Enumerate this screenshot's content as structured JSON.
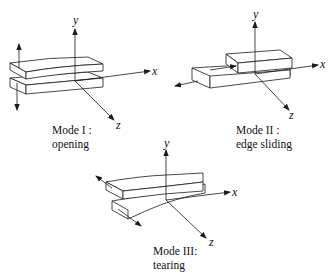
{
  "figure": {
    "modes": [
      {
        "id": "mode-1",
        "title": "Mode I :",
        "subtitle": "opening",
        "axes": {
          "x": "x",
          "y": "y",
          "z": "z"
        }
      },
      {
        "id": "mode-2",
        "title": "Mode II :",
        "subtitle": "edge sliding",
        "axes": {
          "x": "x",
          "y": "y",
          "z": "z"
        }
      },
      {
        "id": "mode-3",
        "title": "Mode III:",
        "subtitle": "tearing",
        "axes": {
          "x": "x",
          "y": "y",
          "z": "z"
        }
      }
    ],
    "colors": {
      "line": "#1a1a1a",
      "background": "#ffffff"
    }
  }
}
